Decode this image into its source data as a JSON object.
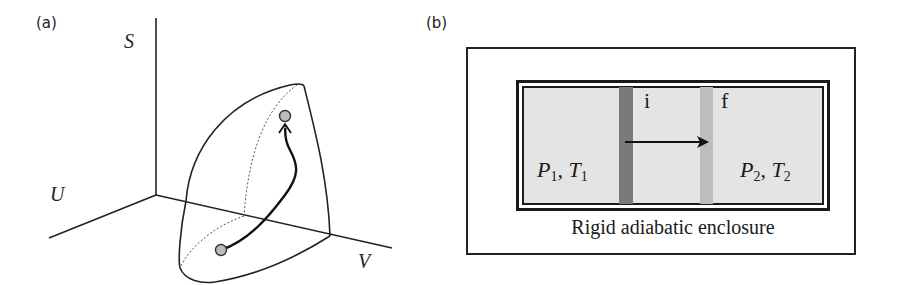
{
  "panel_a": {
    "label": "(a)",
    "axes": {
      "s": "S",
      "u": "U",
      "v": "V"
    },
    "points": [
      "initial",
      "final"
    ]
  },
  "panel_b": {
    "label": "(b)",
    "left_state": {
      "p": "P",
      "p_sub": "1",
      "sep": ", ",
      "t": "T",
      "t_sub": "1"
    },
    "right_state": {
      "p": "P",
      "p_sub": "2",
      "sep": ", ",
      "t": "T",
      "t_sub": "2"
    },
    "initial_label": "i",
    "final_label": "f",
    "caption": "Rigid adiabatic enclosure",
    "colors": {
      "piston_initial": "#7a7a7a",
      "piston_final": "#bdbdbd",
      "gas": "#e4e4e4"
    }
  }
}
